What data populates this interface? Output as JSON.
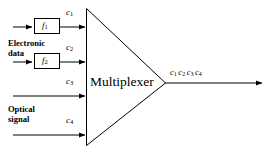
{
  "diagram": {
    "mux": {
      "label": "Multiplexer",
      "shape": "triangle"
    },
    "colors": {
      "stroke": "#000000",
      "background": "#ffffff",
      "text": "#000000"
    },
    "groups": [
      {
        "name": "electronic-data",
        "label_line1": "Electronic",
        "label_line2": "data"
      },
      {
        "name": "optical-signal",
        "label_line1": "Optical",
        "label_line2": "signal"
      }
    ],
    "inputs": [
      {
        "name": "input-1",
        "channel_base": "c",
        "channel_sub": "1",
        "has_block": true,
        "block_base": "f",
        "block_sub": "1",
        "source": "electronic-data"
      },
      {
        "name": "input-2",
        "channel_base": "c",
        "channel_sub": "2",
        "has_block": true,
        "block_base": "f",
        "block_sub": "2",
        "source": "electronic-data"
      },
      {
        "name": "input-3",
        "channel_base": "c",
        "channel_sub": "3",
        "has_block": false,
        "source": "optical-signal"
      },
      {
        "name": "input-4",
        "channel_base": "c",
        "channel_sub": "4",
        "has_block": false,
        "source": "optical-signal"
      }
    ],
    "output": {
      "name": "multiplexed-output",
      "channels": [
        {
          "base": "c",
          "sub": "1"
        },
        {
          "base": "c",
          "sub": "2"
        },
        {
          "base": "c",
          "sub": "3"
        },
        {
          "base": "c",
          "sub": "4"
        }
      ]
    }
  }
}
